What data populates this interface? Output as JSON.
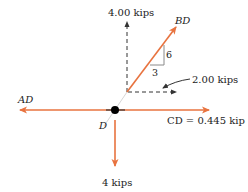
{
  "diagram": {
    "type": "free-body-diagram",
    "node": {
      "label": "D"
    },
    "colors": {
      "member_force": "#e8733f",
      "component": "#333333",
      "node": "#000000",
      "triangle": "#8a8a8a"
    },
    "forces": {
      "bd": {
        "label": "BD",
        "direction": "up-right"
      },
      "ad": {
        "label": "AD",
        "direction": "left"
      },
      "cd": {
        "label": "CD = 0.445 kip",
        "direction": "right"
      },
      "load": {
        "label": "4 kips",
        "direction": "down"
      }
    },
    "components": {
      "vertical": {
        "label": "4.00 kips"
      },
      "horizontal": {
        "label": "2.00 kips"
      }
    },
    "slope_triangle": {
      "rise": "6",
      "run": "3"
    }
  }
}
